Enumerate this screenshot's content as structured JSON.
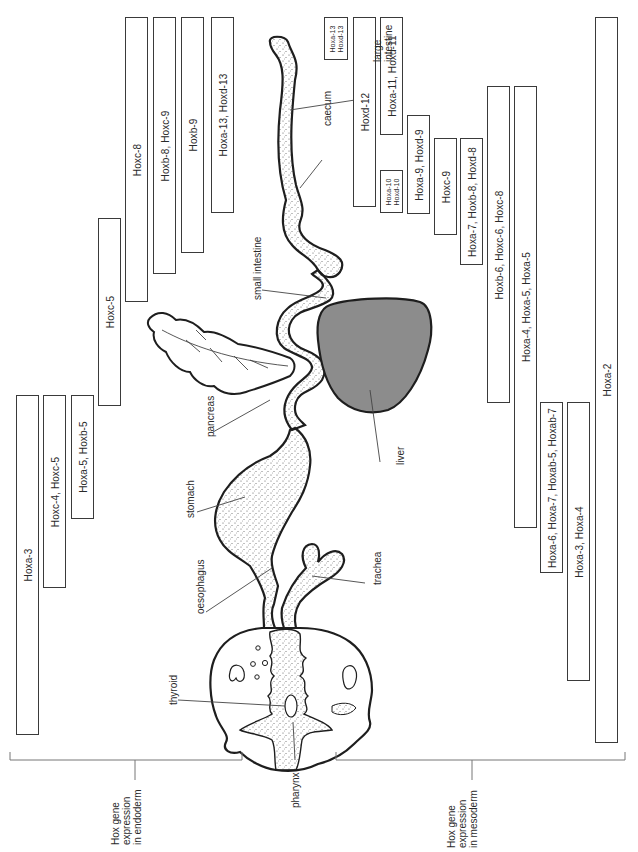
{
  "figure": {
    "endoderm_group": {
      "label": "Hox gene\nexpression\nin endoderm",
      "boxes": [
        {
          "label": "Hoxa-3",
          "x": 16,
          "y": 395,
          "w": 23,
          "h": 340
        },
        {
          "label": "Hoxc-4, Hoxc-5",
          "x": 43,
          "y": 395,
          "w": 23,
          "h": 193
        },
        {
          "label": "Hoxa-5, Hoxb-5",
          "x": 71,
          "y": 395,
          "w": 23,
          "h": 124
        },
        {
          "label": "Hoxc-5",
          "x": 98,
          "y": 218,
          "w": 23,
          "h": 188
        },
        {
          "label": "Hoxc-8",
          "x": 125,
          "y": 17,
          "w": 23,
          "h": 285
        },
        {
          "label": "Hoxb-8, Hoxc-9",
          "x": 153,
          "y": 17,
          "w": 23,
          "h": 257
        },
        {
          "label": "Hoxb-9",
          "x": 181,
          "y": 17,
          "w": 23,
          "h": 236
        },
        {
          "label": "Hoxa-13, Hoxd-13",
          "x": 211,
          "y": 17,
          "w": 23,
          "h": 196
        }
      ]
    },
    "mesoderm_group": {
      "label": "Hox gene\nexpression\nin mesoderm",
      "boxes": [
        {
          "label": "Hoxa-13\nHoxd-13",
          "x": 324,
          "y": 17,
          "w": 24,
          "h": 43,
          "small": true
        },
        {
          "label": "Hoxd-12",
          "x": 353,
          "y": 17,
          "w": 23,
          "h": 190
        },
        {
          "label": "Hoxa-11, Hoxd-11",
          "x": 380,
          "y": 17,
          "w": 23,
          "h": 118
        },
        {
          "label": "Hoxa-10\nHoxd-10",
          "x": 380,
          "y": 170,
          "w": 23,
          "h": 43,
          "small": true
        },
        {
          "label": "Hoxa-9, Hoxd-9",
          "x": 407,
          "y": 115,
          "w": 23,
          "h": 99
        },
        {
          "label": "Hoxc-9",
          "x": 434,
          "y": 138,
          "w": 23,
          "h": 97
        },
        {
          "label": "Hoxa-7, Hoxb-8, Hoxd-8",
          "x": 460,
          "y": 138,
          "w": 23,
          "h": 127
        },
        {
          "label": "Hoxb-6, Hoxc-6, Hoxc-8",
          "x": 487,
          "y": 86,
          "w": 23,
          "h": 317
        },
        {
          "label": "Hoxa-4, Hoxa-5, Hoxa-5",
          "x": 514,
          "y": 86,
          "w": 23,
          "h": 442
        },
        {
          "label": "Hoxa-6, Hoxa-7, Hoxab-5, Hoxab-7",
          "x": 540,
          "y": 402,
          "w": 23,
          "h": 171
        },
        {
          "label": "Hoxa-3, Hoxa-4",
          "x": 567,
          "y": 402,
          "w": 23,
          "h": 279
        },
        {
          "label": "Hoxa-2",
          "x": 595,
          "y": 17,
          "w": 23,
          "h": 726
        }
      ]
    },
    "organ_labels": [
      {
        "label": "large\nintestine",
        "x": 372,
        "y": 62
      },
      {
        "label": "caecum",
        "x": 322,
        "y": 126
      },
      {
        "label": "small intestine",
        "x": 252,
        "y": 300
      },
      {
        "label": "pancreas",
        "x": 205,
        "y": 437
      },
      {
        "label": "liver",
        "x": 395,
        "y": 465
      },
      {
        "label": "stomach",
        "x": 185,
        "y": 518
      },
      {
        "label": "oesophagus",
        "x": 195,
        "y": 614
      },
      {
        "label": "trachea",
        "x": 372,
        "y": 585
      },
      {
        "label": "thyroid",
        "x": 168,
        "y": 705
      },
      {
        "label": "pharynx",
        "x": 290,
        "y": 808
      }
    ],
    "colors": {
      "stroke": "#1e1e1e",
      "box_border": "#3a3a3a",
      "liver_fill": "#8c8c8c",
      "stipple": "#555555",
      "bracket": "#777777"
    }
  }
}
